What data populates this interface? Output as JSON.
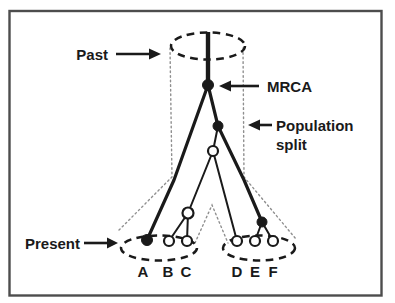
{
  "figure": {
    "annotations": {
      "past": "Past",
      "mrca": "MRCA",
      "population_split": [
        "Population",
        "split"
      ],
      "present": "Present"
    },
    "leaf_labels": [
      "A",
      "B",
      "C",
      "D",
      "E",
      "F"
    ],
    "colors": {
      "ink": "#1a1a1a",
      "dotted_boundary": "#8f8f8f",
      "frame_border": "#4d4d4d",
      "background": "#ffffff"
    }
  }
}
